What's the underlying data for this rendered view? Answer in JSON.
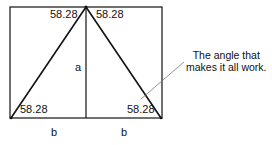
{
  "diagram": {
    "angles": {
      "apex_left": "58.28",
      "apex_right": "58.28",
      "base_left": "58.28",
      "base_right": "58.28"
    },
    "labels": {
      "height": "a",
      "base_left": "b",
      "base_right": "b"
    },
    "annotation": {
      "line1": "The angle that",
      "line2": "makes it all work."
    },
    "colors": {
      "stroke": "#111111",
      "pointer": "#777777",
      "background": "#ffffff"
    }
  }
}
